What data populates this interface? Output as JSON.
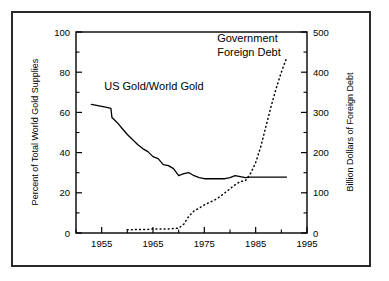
{
  "figure": {
    "frame_color": "#2a2a2a",
    "background": "#ffffff",
    "line_color": "#000000"
  },
  "chart_data": {
    "type": "line",
    "title": "",
    "subtitle": "",
    "xlabel": "",
    "ylabel": "Percent of Total World Gold Supplies",
    "y2label": "Billion Dollars of Foreign Debt",
    "xlim": [
      1950,
      1995
    ],
    "ylim": [
      0,
      100
    ],
    "y2lim": [
      0,
      500
    ],
    "xticks": [
      1955,
      1965,
      1975,
      1985,
      1995
    ],
    "xtick_labels": [
      "1955",
      "1965",
      "1975",
      "1985",
      "1995"
    ],
    "x_minor_ticks": [
      1950,
      1960,
      1970,
      1980,
      1990
    ],
    "yticks": [
      0,
      20,
      40,
      60,
      80,
      100
    ],
    "ytick_labels": [
      "0",
      "20",
      "40",
      "60",
      "80",
      "100"
    ],
    "y_minor_ticks": [
      10,
      30,
      50,
      70,
      90
    ],
    "y2ticks": [
      0,
      100,
      200,
      300,
      400,
      500
    ],
    "y2tick_labels": [
      "0",
      "100",
      "200",
      "300",
      "400",
      "500"
    ],
    "y2_minor_ticks": [
      50,
      150,
      250,
      350,
      450
    ],
    "grid": false,
    "legend_position": "inline-annotations",
    "annotations": [
      {
        "text": "US Gold/World Gold",
        "x": 1955.5,
        "y": 71,
        "anchor": "start"
      },
      {
        "text": "Government",
        "x": 1977.5,
        "y": 95,
        "anchor": "start"
      },
      {
        "text": "Foreign Debt",
        "x": 1977.5,
        "y": 88,
        "anchor": "start"
      }
    ],
    "series": [
      {
        "name": "US Gold/World Gold",
        "axis": "left",
        "style": "solid",
        "units": "percent",
        "x": [
          1953.0,
          1954.0,
          1955.0,
          1956.0,
          1956.8,
          1957.0,
          1958.0,
          1959.0,
          1960.0,
          1961.0,
          1962.0,
          1963.0,
          1964.0,
          1965.0,
          1966.0,
          1967.0,
          1968.0,
          1969.0,
          1970.0,
          1971.0,
          1972.0,
          1973.0,
          1974.0,
          1975.0,
          1976.0,
          1977.0,
          1978.0,
          1979.0,
          1980.0,
          1981.0,
          1982.0,
          1983.0,
          1984.0,
          1985.0,
          1986.0,
          1987.0,
          1988.0,
          1989.0,
          1990.0,
          1991.0
        ],
        "values": [
          64.0,
          63.5,
          63.0,
          62.5,
          62.0,
          57.5,
          55.0,
          52.0,
          49.0,
          46.5,
          44.0,
          42.0,
          40.5,
          38.0,
          37.0,
          34.0,
          33.5,
          32.0,
          28.5,
          29.5,
          30.0,
          28.5,
          27.5,
          27.0,
          27.0,
          27.0,
          27.0,
          27.0,
          27.5,
          28.5,
          28.0,
          27.5,
          27.8,
          27.8,
          27.8,
          27.8,
          27.8,
          27.8,
          27.8,
          27.8
        ]
      },
      {
        "name": "Government Foreign Debt",
        "axis": "right",
        "style": "dotted",
        "units": "billion dollars",
        "x": [
          1960.0,
          1961.0,
          1962.0,
          1963.0,
          1964.0,
          1965.0,
          1966.0,
          1967.0,
          1968.0,
          1969.0,
          1970.0,
          1971.0,
          1972.0,
          1973.0,
          1974.0,
          1975.0,
          1976.0,
          1977.0,
          1978.0,
          1979.0,
          1980.0,
          1981.0,
          1982.0,
          1983.0,
          1984.0,
          1985.0,
          1986.0,
          1987.0,
          1988.0,
          1989.0,
          1990.0,
          1991.0
        ],
        "values": [
          8,
          8,
          9,
          9,
          9,
          10,
          10,
          10,
          10,
          11,
          12,
          22,
          42,
          55,
          62,
          70,
          76,
          82,
          90,
          100,
          110,
          120,
          128,
          130,
          148,
          175,
          215,
          265,
          315,
          360,
          400,
          435
        ]
      }
    ]
  },
  "axes": {
    "left_title": "Percent of Total World Gold Supplies",
    "right_title": "Billion Dollars of Foreign Debt"
  }
}
